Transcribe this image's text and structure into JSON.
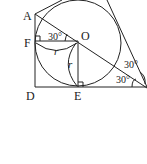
{
  "diagram": {
    "points": {
      "A": "A",
      "F": "F",
      "O": "O",
      "D": "D",
      "E": "E"
    },
    "radius_label": "r",
    "angle_labels": {
      "at_O": "30°",
      "right_upper": "30°",
      "right_lower": "30°"
    }
  }
}
